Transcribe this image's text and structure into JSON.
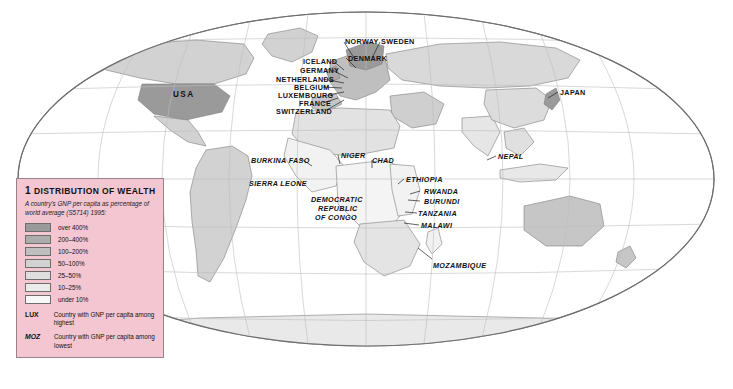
{
  "map": {
    "projection": "mollweide",
    "ocean_color": "#ffffff",
    "graticule_color": "#b9b9b9",
    "coast_color": "#8a8a8a"
  },
  "legend": {
    "number": "1",
    "title": "Distribution of wealth",
    "subtitle": "A country's GNP per capita as percentage of world average (S5714) 1995:",
    "classes": [
      {
        "label": "over 400%",
        "color": "#9a9a9a"
      },
      {
        "label": "200–400%",
        "color": "#acacac"
      },
      {
        "label": "100–200%",
        "color": "#bfbfbf"
      },
      {
        "label": "50–100%",
        "color": "#d2d2d2"
      },
      {
        "label": "25–50%",
        "color": "#dedede"
      },
      {
        "label": "10–25%",
        "color": "#ebebeb"
      },
      {
        "label": "under 10%",
        "color": "#f7f7f7"
      }
    ],
    "codes": [
      {
        "code": "LUX",
        "style": "bold",
        "text": "Country with GNP per capita among highest"
      },
      {
        "code": "MOZ",
        "style": "italic",
        "text": "Country with GNP per capita among lowest"
      }
    ]
  },
  "labels": [
    {
      "text": "USA",
      "x": 173,
      "y": 91,
      "style": "big"
    },
    {
      "text": "NORWAY",
      "x": 345,
      "y": 38,
      "style": "bold"
    },
    {
      "text": "SWEDEN",
      "x": 381,
      "y": 38,
      "style": "bold"
    },
    {
      "text": "ICELAND",
      "x": 303,
      "y": 58,
      "style": "bold"
    },
    {
      "text": "DENMARK",
      "x": 348,
      "y": 55,
      "style": "bold"
    },
    {
      "text": "GERMANY",
      "x": 300,
      "y": 67,
      "style": "bold"
    },
    {
      "text": "NETHERLANDS",
      "x": 276,
      "y": 76,
      "style": "bold"
    },
    {
      "text": "BELGIUM",
      "x": 294,
      "y": 84,
      "style": "bold"
    },
    {
      "text": "LUXEMBOURG",
      "x": 278,
      "y": 92,
      "style": "bold"
    },
    {
      "text": "FRANCE",
      "x": 299,
      "y": 100,
      "style": "bold"
    },
    {
      "text": "SWITZERLAND",
      "x": 276,
      "y": 108,
      "style": "bold"
    },
    {
      "text": "JAPAN",
      "x": 560,
      "y": 89,
      "style": "bold"
    },
    {
      "text": "BURKINA FASO",
      "x": 251,
      "y": 157,
      "style": "italic"
    },
    {
      "text": "NIGER",
      "x": 341,
      "y": 152,
      "style": "italic"
    },
    {
      "text": "CHAD",
      "x": 372,
      "y": 157,
      "style": "italic"
    },
    {
      "text": "SIERRA LEONE",
      "x": 249,
      "y": 180,
      "style": "italic"
    },
    {
      "text": "ETHIOPIA",
      "x": 406,
      "y": 176,
      "style": "italic"
    },
    {
      "text": "RWANDA",
      "x": 424,
      "y": 188,
      "style": "italic"
    },
    {
      "text": "BURUNDI",
      "x": 424,
      "y": 198,
      "style": "italic"
    },
    {
      "text": "DEMOCRATIC",
      "x": 311,
      "y": 196,
      "style": "italic"
    },
    {
      "text": "REPUBLIC",
      "x": 318,
      "y": 205,
      "style": "italic"
    },
    {
      "text": "OF CONGO",
      "x": 315,
      "y": 214,
      "style": "italic"
    },
    {
      "text": "TANZANIA",
      "x": 418,
      "y": 210,
      "style": "italic"
    },
    {
      "text": "MALAWI",
      "x": 421,
      "y": 222,
      "style": "italic"
    },
    {
      "text": "MOZAMBIQUE",
      "x": 433,
      "y": 262,
      "style": "italic"
    },
    {
      "text": "NEPAL",
      "x": 498,
      "y": 153,
      "style": "italic"
    }
  ],
  "leaders": [
    {
      "x1": 332,
      "y1": 60,
      "x2": 344,
      "y2": 70
    },
    {
      "x1": 344,
      "y1": 42,
      "x2": 354,
      "y2": 58
    },
    {
      "x1": 380,
      "y1": 42,
      "x2": 372,
      "y2": 58
    },
    {
      "x1": 346,
      "y1": 58,
      "x2": 356,
      "y2": 68
    },
    {
      "x1": 332,
      "y1": 70,
      "x2": 348,
      "y2": 78
    },
    {
      "x1": 323,
      "y1": 79,
      "x2": 344,
      "y2": 83
    },
    {
      "x1": 323,
      "y1": 87,
      "x2": 342,
      "y2": 88
    },
    {
      "x1": 328,
      "y1": 95,
      "x2": 344,
      "y2": 92
    },
    {
      "x1": 323,
      "y1": 103,
      "x2": 338,
      "y2": 98
    },
    {
      "x1": 325,
      "y1": 111,
      "x2": 344,
      "y2": 100
    },
    {
      "x1": 420,
      "y1": 191,
      "x2": 410,
      "y2": 194
    },
    {
      "x1": 420,
      "y1": 201,
      "x2": 408,
      "y2": 200
    },
    {
      "x1": 417,
      "y1": 213,
      "x2": 405,
      "y2": 212
    },
    {
      "x1": 419,
      "y1": 225,
      "x2": 404,
      "y2": 223
    },
    {
      "x1": 432,
      "y1": 259,
      "x2": 418,
      "y2": 248
    },
    {
      "x1": 338,
      "y1": 155,
      "x2": 340,
      "y2": 164
    },
    {
      "x1": 372,
      "y1": 160,
      "x2": 372,
      "y2": 168
    },
    {
      "x1": 300,
      "y1": 158,
      "x2": 312,
      "y2": 166
    },
    {
      "x1": 298,
      "y1": 181,
      "x2": 300,
      "y2": 186
    },
    {
      "x1": 496,
      "y1": 156,
      "x2": 487,
      "y2": 160
    },
    {
      "x1": 558,
      "y1": 92,
      "x2": 548,
      "y2": 98
    },
    {
      "x1": 404,
      "y1": 179,
      "x2": 398,
      "y2": 184
    }
  ]
}
